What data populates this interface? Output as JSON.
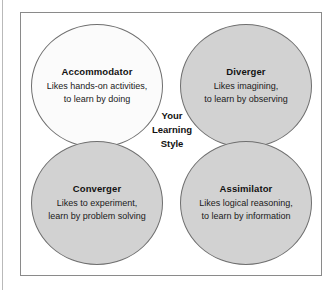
{
  "figure": {
    "center_caption": {
      "line1": "Your",
      "line2": "Learning",
      "line3": "Style"
    },
    "quadrants": [
      {
        "key": "accommodator",
        "title": "Accommodator",
        "desc_line1": "Likes hands-on activities,",
        "desc_line2": "to learn by doing",
        "fill": "#fbfbfb"
      },
      {
        "key": "diverger",
        "title": "Diverger",
        "desc_line1": "Likes imagining,",
        "desc_line2": "to learn by observing",
        "fill": "#d2d2d2"
      },
      {
        "key": "converger",
        "title": "Converger",
        "desc_line1": "Likes to experiment,",
        "desc_line2": "learn by problem solving",
        "fill": "#d2d2d2"
      },
      {
        "key": "assimilator",
        "title": "Assimilator",
        "desc_line1": "Likes logical reasoning,",
        "desc_line2": "to learn by information",
        "fill": "#d2d2d2"
      }
    ]
  }
}
